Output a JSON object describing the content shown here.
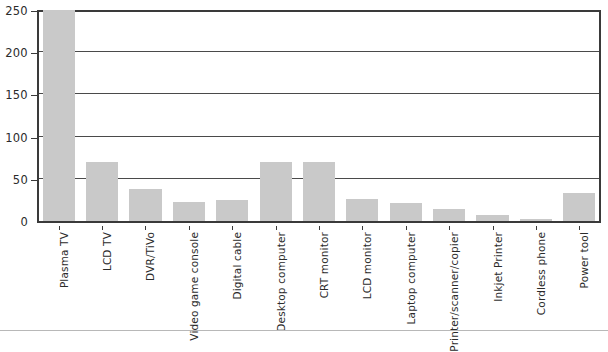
{
  "chart_data": {
    "type": "bar",
    "title": "",
    "subtitle": "",
    "xlabel": "",
    "ylabel": "",
    "ylim": [
      0,
      250
    ],
    "yticks": [
      0,
      50,
      100,
      150,
      200,
      250
    ],
    "grid": true,
    "legend": null,
    "orientation": "vertical",
    "bar_color": "#c9c9c9",
    "categories": [
      "Plasma TV",
      "LCD TV",
      "DVR/TiVo",
      "Video game console",
      "Digital cable",
      "Desktop computer",
      "CRT monitor",
      "LCD monitor",
      "Laptop computer",
      "Printer/scanner/copier",
      "Inkjet Printer",
      "Cordless phone",
      "Power tool"
    ],
    "values": [
      250,
      70,
      38,
      23,
      25,
      70,
      70,
      26,
      21,
      14,
      7,
      2,
      33
    ]
  },
  "axes": {
    "y_tick_labels": [
      "0",
      "50",
      "100",
      "150",
      "200",
      "250"
    ]
  }
}
